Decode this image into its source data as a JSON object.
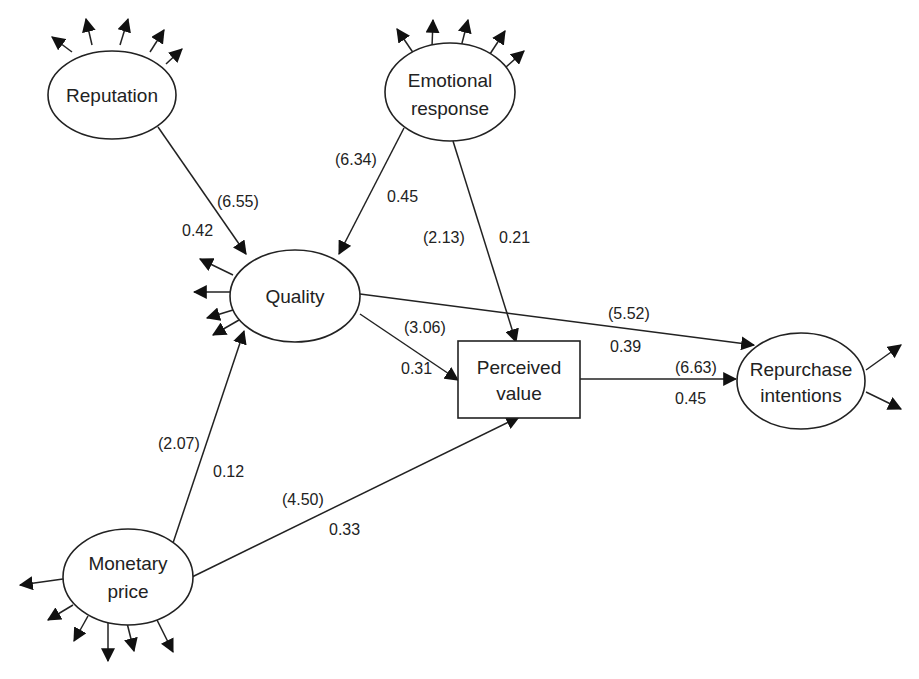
{
  "nodes": {
    "reputation": {
      "label": "Reputation",
      "shape": "ellipse"
    },
    "emotional_response": {
      "line1": "Emotional",
      "line2": "response",
      "shape": "ellipse"
    },
    "quality": {
      "label": "Quality",
      "shape": "ellipse"
    },
    "perceived_value": {
      "line1": "Perceived",
      "line2": "value",
      "shape": "rectangle"
    },
    "repurchase_intentions": {
      "line1": "Repurchase",
      "line2": "intentions",
      "shape": "ellipse"
    },
    "monetary_price": {
      "line1": "Monetary",
      "line2": "price",
      "shape": "ellipse"
    }
  },
  "edges": [
    {
      "from": "Reputation",
      "to": "Quality",
      "t_value": "(6.55)",
      "coefficient": "0.42"
    },
    {
      "from": "Emotional response",
      "to": "Quality",
      "t_value": "(6.34)",
      "coefficient": "0.45"
    },
    {
      "from": "Emotional response",
      "to": "Perceived value",
      "t_value": "(2.13)",
      "coefficient": "0.21"
    },
    {
      "from": "Quality",
      "to": "Perceived value",
      "t_value": "(3.06)",
      "coefficient": "0.31"
    },
    {
      "from": "Quality",
      "to": "Repurchase intentions",
      "t_value": "(5.52)",
      "coefficient": "0.39"
    },
    {
      "from": "Perceived value",
      "to": "Repurchase intentions",
      "t_value": "(6.63)",
      "coefficient": "0.45"
    },
    {
      "from": "Monetary price",
      "to": "Quality",
      "t_value": "(2.07)",
      "coefficient": "0.12"
    },
    {
      "from": "Monetary price",
      "to": "Perceived value",
      "t_value": "(4.50)",
      "coefficient": "0.33"
    }
  ],
  "indicator_arrows": {
    "reputation": 5,
    "emotional_response": 5,
    "quality": 5,
    "repurchase_intentions": 2,
    "monetary_price": 6
  },
  "colors": {
    "stroke": "#222222",
    "background": "#ffffff"
  }
}
